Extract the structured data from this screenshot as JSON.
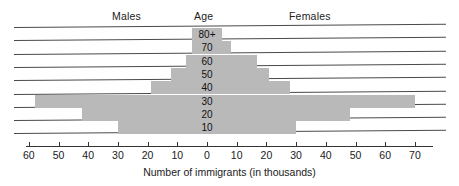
{
  "header": {
    "males_label": "Males",
    "age_label": "Age",
    "females_label": "Females"
  },
  "axis": {
    "caption": "Number of immigrants (in thousands)",
    "left_ticks": [
      "60",
      "50",
      "40",
      "30",
      "20",
      "10"
    ],
    "center_tick": "0",
    "right_ticks": [
      "10",
      "20",
      "30",
      "40",
      "50",
      "60",
      "70"
    ]
  },
  "colors": {
    "bar_fill": "#b9b9b9",
    "rule_line": "#4a4a4a",
    "axis_line": "#333333",
    "text": "#1a1a1a",
    "background": "#ffffff"
  },
  "chart_data": {
    "type": "bar",
    "subtype": "population-pyramid",
    "title": "",
    "xlabel": "Number of immigrants (in thousands)",
    "ylabel": "Age",
    "categories": [
      "10",
      "20",
      "30",
      "40",
      "50",
      "60",
      "70",
      "80+"
    ],
    "series": [
      {
        "name": "Males",
        "values": [
          30,
          42,
          58,
          19,
          12,
          7,
          5,
          5
        ]
      },
      {
        "name": "Females",
        "values": [
          30,
          48,
          70,
          28,
          21,
          17,
          8,
          5
        ]
      }
    ],
    "rows": [
      {
        "age": "80+",
        "males": 5,
        "females": 5
      },
      {
        "age": "70",
        "males": 5,
        "females": 8
      },
      {
        "age": "60",
        "males": 7,
        "females": 17
      },
      {
        "age": "50",
        "males": 12,
        "females": 21
      },
      {
        "age": "40",
        "males": 19,
        "females": 28
      },
      {
        "age": "30",
        "males": 58,
        "females": 70
      },
      {
        "age": "20",
        "males": 42,
        "females": 48
      },
      {
        "age": "10",
        "males": 30,
        "females": 30
      }
    ],
    "xlim": [
      -60,
      70
    ],
    "x_tick_values": [
      -60,
      -50,
      -40,
      -30,
      -20,
      -10,
      0,
      10,
      20,
      30,
      40,
      50,
      60,
      70
    ],
    "grid": false,
    "legend": "none",
    "units": "thousands"
  }
}
